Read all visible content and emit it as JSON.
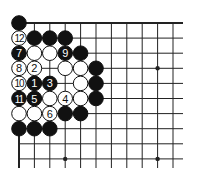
{
  "board": {
    "title": "Go problem diagram (top-left corner)",
    "origin_x": 19,
    "origin_y": 23,
    "spacing_x": 15.4,
    "spacing_y": 15.1,
    "cols": 11,
    "rows": 10,
    "line_end_x": 183,
    "line_end_y": 168,
    "star_points": [
      [
        3,
        9
      ],
      [
        9,
        3
      ],
      [
        9,
        9
      ]
    ],
    "colors": {
      "black": "#111111",
      "white": "#ffffff",
      "line": "#222222"
    }
  },
  "stones": [
    {
      "col": 0,
      "row": 0,
      "color": "black",
      "label": ""
    },
    {
      "col": 0,
      "row": 1,
      "color": "white",
      "label": "12"
    },
    {
      "col": 1,
      "row": 1,
      "color": "black",
      "label": ""
    },
    {
      "col": 2,
      "row": 1,
      "color": "black",
      "label": ""
    },
    {
      "col": 3,
      "row": 1,
      "color": "black",
      "label": ""
    },
    {
      "col": 0,
      "row": 2,
      "color": "black",
      "label": "7"
    },
    {
      "col": 1,
      "row": 2,
      "color": "white",
      "label": ""
    },
    {
      "col": 2,
      "row": 2,
      "color": "white",
      "label": ""
    },
    {
      "col": 3,
      "row": 2,
      "color": "black",
      "label": "9"
    },
    {
      "col": 4,
      "row": 2,
      "color": "black",
      "label": ""
    },
    {
      "col": 0,
      "row": 3,
      "color": "white",
      "label": "8"
    },
    {
      "col": 1,
      "row": 3,
      "color": "white",
      "label": "2"
    },
    {
      "col": 3,
      "row": 3,
      "color": "white",
      "label": ""
    },
    {
      "col": 4,
      "row": 3,
      "color": "white",
      "label": ""
    },
    {
      "col": 5,
      "row": 3,
      "color": "black",
      "label": ""
    },
    {
      "col": 0,
      "row": 4,
      "color": "white",
      "label": "10"
    },
    {
      "col": 1,
      "row": 4,
      "color": "black",
      "label": "1"
    },
    {
      "col": 2,
      "row": 4,
      "color": "black",
      "label": "3"
    },
    {
      "col": 4,
      "row": 4,
      "color": "white",
      "label": ""
    },
    {
      "col": 5,
      "row": 4,
      "color": "black",
      "label": ""
    },
    {
      "col": 0,
      "row": 5,
      "color": "black",
      "label": "11"
    },
    {
      "col": 1,
      "row": 5,
      "color": "black",
      "label": "5"
    },
    {
      "col": 2,
      "row": 5,
      "color": "white",
      "label": ""
    },
    {
      "col": 3,
      "row": 5,
      "color": "white",
      "label": "4"
    },
    {
      "col": 4,
      "row": 5,
      "color": "white",
      "label": ""
    },
    {
      "col": 5,
      "row": 5,
      "color": "black",
      "label": ""
    },
    {
      "col": 0,
      "row": 6,
      "color": "white",
      "label": ""
    },
    {
      "col": 1,
      "row": 6,
      "color": "white",
      "label": ""
    },
    {
      "col": 2,
      "row": 6,
      "color": "white",
      "label": "6"
    },
    {
      "col": 3,
      "row": 6,
      "color": "black",
      "label": ""
    },
    {
      "col": 4,
      "row": 6,
      "color": "black",
      "label": ""
    },
    {
      "col": 0,
      "row": 7,
      "color": "black",
      "label": ""
    },
    {
      "col": 1,
      "row": 7,
      "color": "black",
      "label": ""
    },
    {
      "col": 2,
      "row": 7,
      "color": "black",
      "label": ""
    }
  ]
}
